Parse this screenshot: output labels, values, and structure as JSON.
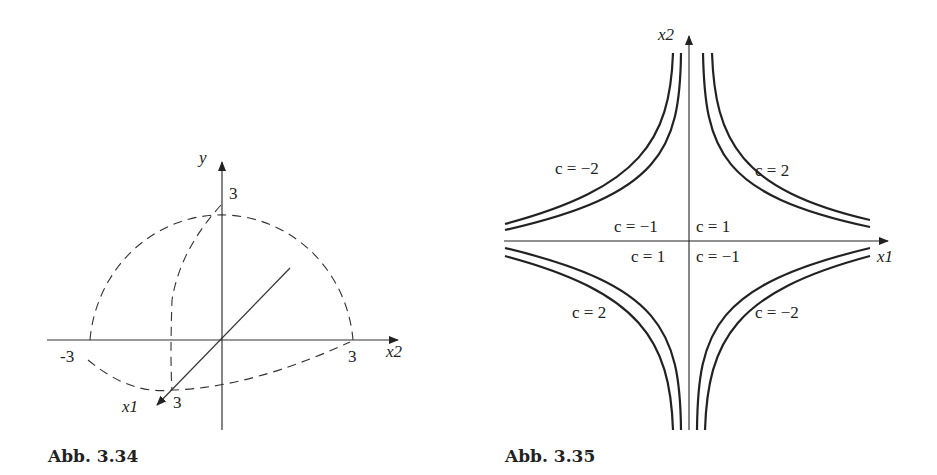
{
  "figures": [
    {
      "caption": "Abb. 3.34",
      "axes": {
        "y": "y",
        "x2": "x2",
        "x1": "x1"
      },
      "ticks": {
        "y_top": "3",
        "x2_neg": "-3",
        "x2_pos": "3",
        "x1_pos": "3"
      }
    },
    {
      "caption": "Abb. 3.35",
      "axes": {
        "x2": "x2",
        "x1": "x1"
      },
      "labels": {
        "q2_outer": "c = −2",
        "q1_outer": "c = 2",
        "q2_inner": "c = −1",
        "q1_inner": "c = 1",
        "q3_inner": "c = 1",
        "q4_inner": "c = −1",
        "q3_outer": "c = 2",
        "q4_outer": "c = −2"
      }
    }
  ]
}
